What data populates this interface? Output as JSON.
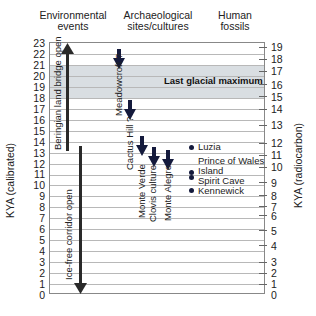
{
  "headers": {
    "environmental": [
      "Environmental",
      "events"
    ],
    "archaeological": [
      "Archaeological",
      "sites/cultures"
    ],
    "human_fossils": [
      "Human",
      "fossils"
    ]
  },
  "axes": {
    "left_title": "KYA (calibrated)",
    "right_title": "KYA (radiocarbon)",
    "left_ticks": [
      "23",
      "22",
      "21",
      "20",
      "19",
      "18",
      "17",
      "16",
      "15",
      "14",
      "13",
      "12",
      "11",
      "10",
      "9",
      "8",
      "7",
      "6",
      "5",
      "4",
      "3",
      "2",
      "1",
      "0"
    ],
    "right_ticks": [
      "19",
      "18",
      "17",
      "16",
      "15",
      "14",
      "13",
      "12",
      "11",
      "10",
      "9",
      "8",
      "7",
      "6",
      "5",
      "4",
      "3",
      "2",
      "1",
      "0"
    ]
  },
  "band": {
    "label": "Last glacial maximum",
    "from_kya": 18,
    "to_kya": 21,
    "color": "#d9dee2"
  },
  "environmental_events": [
    {
      "label": "Beringian land bridge open",
      "from_kya": 13,
      "to_kya": 23,
      "direction": "up"
    },
    {
      "label": "Ice-free corridor open",
      "from_kya": 0,
      "to_kya": 13.5,
      "direction": "down"
    }
  ],
  "archaeological_sites": [
    {
      "label": "Meadowcroft ?",
      "kya": 22
    },
    {
      "label": "Cactus Hill ?",
      "kya": 16.5
    },
    {
      "label": "Monte Verde",
      "kya": 14
    },
    {
      "label": "Clovis culture",
      "kya": 13
    },
    {
      "label": "Monte Alegre",
      "kya": 12.8
    }
  ],
  "human_fossils": [
    {
      "label": "Luzia",
      "kya": 11.5
    },
    {
      "label": "Prince of Wales Island",
      "label_lines": [
        "Prince of Wales",
        "Island"
      ],
      "kya": 10.8
    },
    {
      "label": "Spirit Cave",
      "kya": 10.3
    },
    {
      "label": "Kennewick",
      "kya": 9.2
    }
  ],
  "colors": {
    "arrow_dark": "#141a3c",
    "bar": "#2a2a2a",
    "grid": "#b8b8b8"
  }
}
